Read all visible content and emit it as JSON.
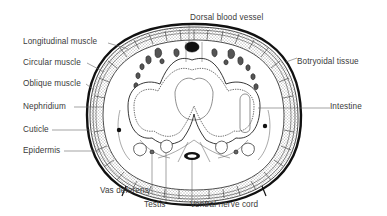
{
  "figure": {
    "colors": {
      "ink": "#111111",
      "label_text": "#3a3a3a",
      "leader_line": "#666666",
      "background": "#ffffff"
    }
  },
  "labels": {
    "dorsal_blood_vessel": "Dorsal blood vessel",
    "longitudinal_muscle": "Longitudinal muscle",
    "circular_muscle": "Circular muscle",
    "oblique_muscle": "Oblique muscle",
    "nephridium": "Nephridium",
    "cuticle": "Cuticle",
    "epidermis": "Epidermis",
    "botryoidal_tissue": "Botryoidal tissue",
    "intestine": "Intestine",
    "vas_deferens": "Vas deferens",
    "testis": "Testis",
    "ventral_nerve_cord": "Ventral nerve cord"
  }
}
